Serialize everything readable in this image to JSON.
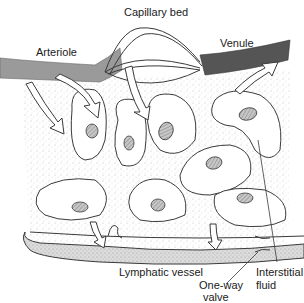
{
  "diagram": {
    "labels": {
      "capillary_bed": "Capillary bed",
      "arteriole": "Arteriole",
      "venule": "Venule",
      "lymphatic_vessel": "Lymphatic vessel",
      "interstitial_fluid_line1": "Interstitial",
      "interstitial_fluid_line2": "fluid",
      "one_way_valve_line1": "One-way",
      "one_way_valve_line2": "valve"
    },
    "colors": {
      "arteriole": "#9a9a9a",
      "venule": "#555555",
      "outline": "#3a3a3a",
      "cell_fill": "#ffffff",
      "nucleus": "#b8b8b8",
      "stipple": "#bdbdbd",
      "lymph_fill": "#d9d9d9"
    }
  }
}
